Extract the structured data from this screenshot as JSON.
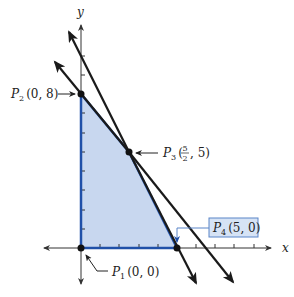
{
  "figure": {
    "type": "feasible-region-diagram",
    "axes": {
      "x_label": "x",
      "y_label": "y",
      "x_ticks": [
        1,
        2,
        3,
        4,
        5,
        6,
        7,
        8,
        9
      ],
      "y_ticks": [
        1,
        2,
        3,
        4,
        5,
        6,
        7,
        8,
        9,
        10
      ]
    },
    "points": [
      {
        "id": "P1",
        "name": "P",
        "sub": "1",
        "coords": "(0, 0)",
        "x": 0,
        "y": 0
      },
      {
        "id": "P2",
        "name": "P",
        "sub": "2",
        "coords": "(0, 8)",
        "x": 0,
        "y": 8
      },
      {
        "id": "P3",
        "name": "P",
        "sub": "3",
        "coords_open": "(",
        "frac_num": "5",
        "frac_den": "2",
        "coords_close": ", 5)",
        "x": 2.5,
        "y": 5
      },
      {
        "id": "P4",
        "name": "P",
        "sub": "4",
        "coords": "(5, 0)",
        "x": 5,
        "y": 0
      }
    ],
    "lines": [
      {
        "name": "constraint-line-1",
        "through": [
          "P2",
          "P3"
        ],
        "equation": "6x + 5y = 40"
      },
      {
        "name": "constraint-line-2",
        "through": [
          "P3",
          "P4"
        ],
        "equation": "2x + y = 10"
      }
    ],
    "region": {
      "vertices": [
        "P1",
        "P2",
        "P3",
        "P4"
      ],
      "fill": "#c9d8f0",
      "border": "#1f4fa8"
    },
    "colors": {
      "axis": "#333333",
      "line": "#1a1a1a",
      "region_fill": "#c8d7ef",
      "region_border": "#2050a8",
      "label_box_fill": "#d6e3f5",
      "label_box_border": "#5b85c8"
    }
  }
}
